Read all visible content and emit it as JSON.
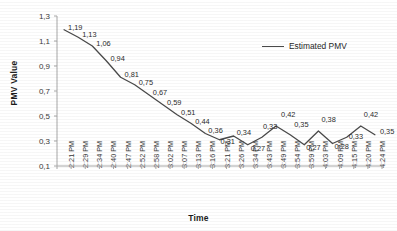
{
  "chart_data": {
    "type": "line",
    "title": "",
    "xlabel": "Time",
    "ylabel": "PMV Value",
    "ylim": [
      0.1,
      1.3
    ],
    "ytick_labels": [
      "1,3",
      "1,1",
      "0,9",
      "0,7",
      "0,5",
      "0,3",
      "0,1"
    ],
    "ytick_values": [
      1.3,
      1.1,
      0.9,
      0.7,
      0.5,
      0.3,
      0.1
    ],
    "grid": false,
    "legend_position": "upper-right-inside",
    "decimal_separator": ",",
    "categories": [
      "2:21 PM",
      "2:29 PM",
      "2:34 PM",
      "2:40 PM",
      "2:47 PM",
      "2:52 PM",
      "2:58 PM",
      "3:02 PM",
      "3:07 PM",
      "3:13 PM",
      "3:16 PM",
      "3:21 PM",
      "3:26 PM",
      "3:34 PM",
      "3:43 PM",
      "3:49 PM",
      "3:54 PM",
      "3:59 PM",
      "4:03 PM",
      "4:09 PM",
      "4:15 PM",
      "4:20 PM",
      "4:24 PM"
    ],
    "series": [
      {
        "name": "Estimated PMV",
        "color": "#4a4a4a",
        "values": [
          1.19,
          1.13,
          1.06,
          0.94,
          0.81,
          0.75,
          0.67,
          0.59,
          0.51,
          0.44,
          0.36,
          0.31,
          0.34,
          0.27,
          0.33,
          0.42,
          0.35,
          0.27,
          0.38,
          0.28,
          0.33,
          0.42,
          0.35
        ],
        "point_labels": [
          "1,19",
          "1,13",
          "1,06",
          "0,94",
          "0,81",
          "0,75",
          "0,67",
          "0,59",
          "0,51",
          "0,44",
          "0,36",
          "0,31",
          "0,34",
          "0,27",
          "0,33",
          "0,42",
          "0,35",
          "0,27",
          "0,38",
          "0,28",
          "0,33",
          "0,42",
          "0,35"
        ]
      }
    ],
    "legend": [
      "Estimated PMV"
    ]
  }
}
